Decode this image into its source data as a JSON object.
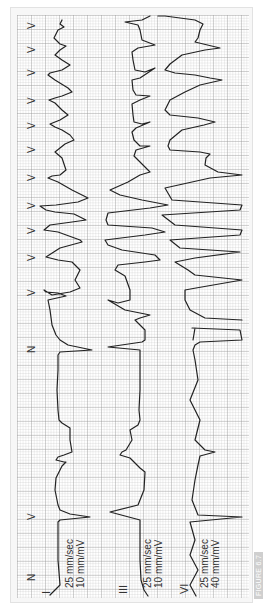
{
  "figure": {
    "label": "FIGURE 6.7",
    "orientation": "rotated 90deg counter-clockwise",
    "grid_color": "#c8c8c8",
    "trace_color": "#222222",
    "background": "#ffffff"
  },
  "leads": [
    {
      "name": "I",
      "speed": "25 mm/sec",
      "gain": "10 mm/mV"
    },
    {
      "name": "III",
      "speed": "25 mm/sec",
      "gain": "10 mm/mV"
    },
    {
      "name": "VI",
      "speed": "25 mm/sec",
      "gain": "40 mm/mV"
    }
  ],
  "beat_labels": [
    {
      "label": "N",
      "y": 575
    },
    {
      "label": "V",
      "y": 515
    },
    {
      "label": "N",
      "y": 347
    },
    {
      "label": "V",
      "y": 290
    },
    {
      "label": "V",
      "y": 255
    },
    {
      "label": "V",
      "y": 228
    },
    {
      "label": "V",
      "y": 203
    },
    {
      "label": "V",
      "y": 175
    },
    {
      "label": "V",
      "y": 147
    },
    {
      "label": "V",
      "y": 123
    },
    {
      "label": "V",
      "y": 98
    },
    {
      "label": "V",
      "y": 70
    },
    {
      "label": "V",
      "y": 47
    },
    {
      "label": "V",
      "y": 23
    }
  ]
}
